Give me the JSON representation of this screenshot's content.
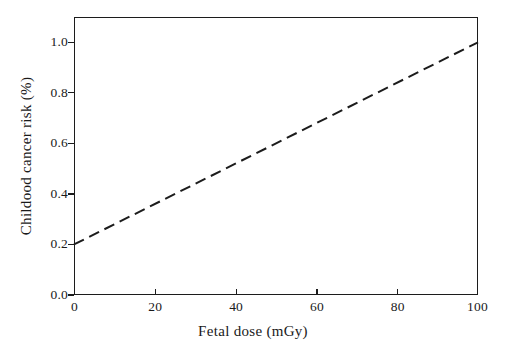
{
  "chart_data": {
    "type": "line",
    "title": "",
    "subtitle": "",
    "xlabel": "Fetal dose (mGy)",
    "ylabel": "Childood cancer risk (%)",
    "xlim": [
      0,
      100
    ],
    "ylim": [
      0.0,
      1.1
    ],
    "xticks": [
      0,
      20,
      40,
      60,
      80,
      100
    ],
    "xtick_labels": [
      "0",
      "20",
      "40",
      "60",
      "80",
      "100"
    ],
    "yticks": [
      0.0,
      0.2,
      0.4,
      0.6,
      0.8,
      1.0
    ],
    "ytick_labels": [
      "0.0",
      "0.2",
      "0.4",
      "0.6",
      "0.8",
      "1.0"
    ],
    "grid": false,
    "legend": null,
    "annotations": [],
    "series": [
      {
        "name": "Childhood cancer risk vs fetal dose",
        "style": "dashed",
        "color": "#1c1c1c",
        "linewidth": 2.0,
        "x": [
          0,
          10,
          20,
          30,
          40,
          50,
          60,
          70,
          80,
          90,
          100
        ],
        "values": [
          0.2,
          0.28,
          0.36,
          0.44,
          0.52,
          0.6,
          0.68,
          0.76,
          0.84,
          0.92,
          1.0
        ]
      }
    ]
  },
  "axis": {
    "frame_color": "#1c1c1c"
  }
}
